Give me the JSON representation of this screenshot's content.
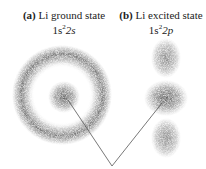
{
  "panels": [
    {
      "tag": "(a)",
      "title": "Li ground state",
      "config_base": "1s",
      "config_sup": "2",
      "config_rest": "2s"
    },
    {
      "tag": "(b)",
      "title": "Li excited state",
      "config_base": "1s",
      "config_sup": "2",
      "config_rest": "2p"
    }
  ],
  "colors": {
    "cloud": "#6a6a6a",
    "line": "#555555"
  }
}
